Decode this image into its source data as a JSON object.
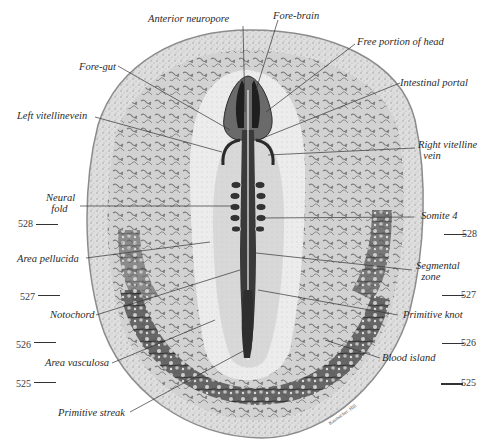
{
  "figure": {
    "colors": {
      "background": "#ffffff",
      "outer_zone": "#d9d9d9",
      "area_pellucida": "#efefef",
      "blood_islands": "#3a3a3a",
      "embryo": "#2b2b2b",
      "leader_lines": "#333333"
    },
    "labels": {
      "anterior_neuropore": "Anterior neuropore",
      "fore_brain": "Fore-brain",
      "free_portion_of_head": "Free portion of head",
      "fore_gut": "Fore-gut",
      "intestinal_portal": "Intestinal portal",
      "left_vitelline_vein": "Left vitellinevein",
      "right_vitelline_vein": "Right vitelline\n  vein",
      "neural_fold": "Neural\n  fold",
      "somite_4": "Somite 4",
      "area_pellucida": "Area pellucida",
      "segmental_zone": "Segmental\n  zone",
      "notochord": "Notochord",
      "primitive_knot": "Primitive knot",
      "area_vasculosa": "Area vasculosa",
      "blood_island": "Blood island",
      "primitive_streak": "Primitive streak"
    },
    "scale_marks": {
      "left": [
        "528",
        "527",
        "526",
        "525"
      ],
      "right": [
        "528",
        "527",
        "526",
        "525"
      ]
    }
  }
}
